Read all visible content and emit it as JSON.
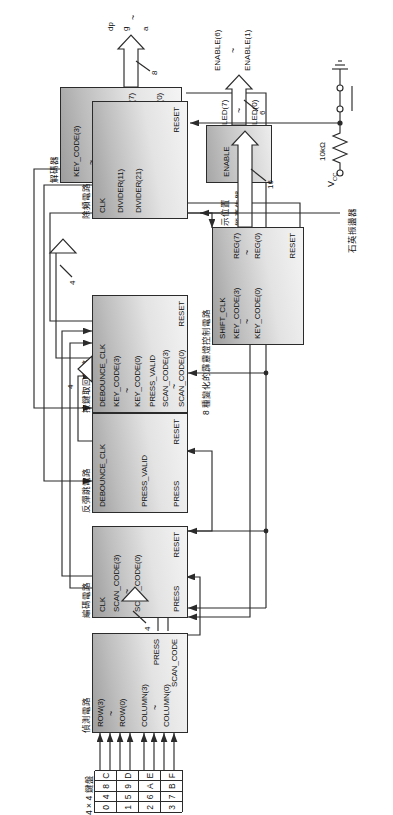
{
  "diagram": {
    "blocks": [
      {
        "id": "detect",
        "label": "偵測電路",
        "inputs": [
          "ROW(3)",
          "ROW(0)",
          "COLUMN(3)",
          "COLUMN(0)"
        ],
        "outputs": [
          "PRESS",
          "SCAN_CODE"
        ]
      },
      {
        "id": "encode",
        "label": "編碼電路",
        "inputs": [
          "CLK",
          "SCAN_CODE(3)",
          "SCAN_CODE(0)",
          "PRESS"
        ],
        "outputs": [
          "RESET"
        ]
      },
      {
        "id": "debounce",
        "label": "反彈跳電路",
        "inputs": [
          "DEBOUNCE_CLK",
          "PRESS_VALID",
          "PRESS"
        ],
        "outputs": [
          "RESET"
        ]
      },
      {
        "id": "keyfetch",
        "label": "按鍵取回電路",
        "inputs": [
          "DEBOUNCE_CLK",
          "KEY_CODE(3)",
          "KEY_CODE(0)",
          "PRESS_VALID",
          "SCAN_CODE(3)",
          "SCAN_CODE(0)"
        ],
        "outputs": [
          "RESET"
        ]
      },
      {
        "id": "decoder",
        "label": "解碼器",
        "inputs": [
          "KEY_CODE(3)",
          "KEY_CODE(0)"
        ],
        "outputs": [
          "SEGMNT(7)",
          "SEGMNT(0)"
        ]
      },
      {
        "id": "enablegen",
        "label": "顯示位置\n致能產生器",
        "label_line1": "顯示位置",
        "label_line2": "致能產生器",
        "body_line1": "ENABLE",
        "body_line2": "“ 111110 ”"
      },
      {
        "id": "ledctrl",
        "label": "8 種變化的霹靂燈控制電路",
        "inputs": [
          "SHIFT_CLK",
          "KEY_CODE(3)",
          "KEY_CODE(0)"
        ],
        "outputs": [
          "REG(7)",
          "REG(0)",
          "RESET"
        ]
      },
      {
        "id": "divider",
        "label": "除頻電路",
        "inputs": [
          "CLK"
        ],
        "outputs": [
          "DIVIDER(11)",
          "DIVIDER(21)",
          "RESET"
        ]
      }
    ],
    "keypad": {
      "label": "4 × 4 鍵盤",
      "rows": [
        [
          "0",
          "4",
          "8",
          "C"
        ],
        [
          "1",
          "5",
          "9",
          "D"
        ],
        [
          "2",
          "6",
          "A",
          "E"
        ],
        [
          "3",
          "7",
          "B",
          "F"
        ]
      ]
    },
    "oscillator": {
      "label": "石英振盪器"
    },
    "reset_circuit": {
      "vcc": "V",
      "vcc_sub": "CC",
      "resistor": "10kΩ"
    },
    "bus_widths": {
      "decoder_out": "8",
      "keycode_bus": "4",
      "scancode_bus": "4",
      "scancode_bus2": "4",
      "enable_bus": "6",
      "led_bus": "16"
    },
    "output_signals": {
      "seg_top": "dp",
      "seg_mid": "g",
      "seg_bot": "a",
      "enable_top": "ENABLE(6)",
      "enable_bot": "ENABLE(1)",
      "led_top": "LED(7)",
      "led_bot": "LED(0)"
    },
    "tilde": "~"
  }
}
